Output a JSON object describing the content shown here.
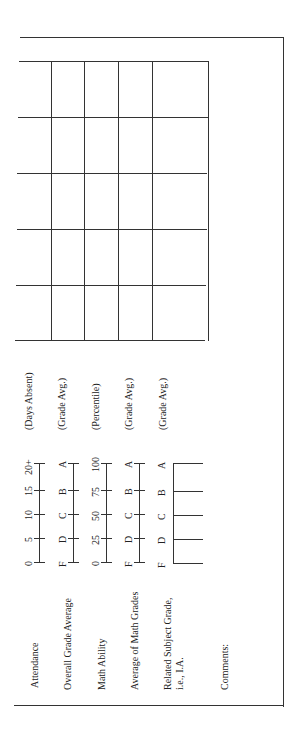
{
  "form": {
    "rows": [
      {
        "label": "Attendance",
        "scale": [
          "0",
          "5",
          "10",
          "15",
          "20+"
        ],
        "unit": "(Days Absent)"
      },
      {
        "label": "Overall Grade Average",
        "scale": [
          "F",
          "D",
          "C",
          "B",
          "A"
        ],
        "unit": "(Grade Avg.)"
      },
      {
        "label": "Math Ability",
        "scale": [
          "0",
          "25",
          "50",
          "75",
          "100"
        ],
        "unit": "(Percentile)"
      },
      {
        "label": "Average of Math Grades",
        "scale": [
          "F",
          "D",
          "C",
          "B",
          "A"
        ],
        "unit": "(Grade Avg.)"
      },
      {
        "label_line1": "Related Subject Grade,",
        "label_line2": "i.e., I.A.",
        "scale": [
          "F",
          "D",
          "C",
          "B",
          "A"
        ],
        "unit": "(Grade Avg.)"
      }
    ],
    "comments_label": "Comments:"
  }
}
